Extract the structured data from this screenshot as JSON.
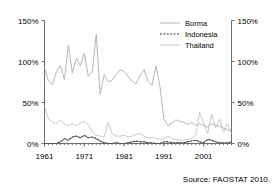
{
  "chart_data": {
    "type": "line",
    "title": "",
    "subtitle": "",
    "xlabel": "",
    "ylabel": "",
    "xlim": [
      1961,
      2008
    ],
    "ylim": [
      0,
      150
    ],
    "y_unit": "%",
    "grid": false,
    "legend_position": "top-right",
    "dual_y_axis": true,
    "source_note": "Source: FAOSTAT 2010.",
    "yticks": [
      0,
      50,
      100,
      150
    ],
    "ytick_labels": [
      "0%",
      "50%",
      "100%",
      "150%"
    ],
    "ytick_labels_right": [
      "0%",
      "50%",
      "100%",
      "150%"
    ],
    "xticks": [
      1961,
      1971,
      1981,
      1991,
      2001
    ],
    "xtick_labels": [
      "1961",
      "1971",
      "1981",
      "1991",
      "2001"
    ],
    "x": [
      1961,
      1962,
      1963,
      1964,
      1965,
      1966,
      1967,
      1968,
      1969,
      1970,
      1971,
      1972,
      1973,
      1974,
      1975,
      1976,
      1977,
      1978,
      1979,
      1980,
      1981,
      1982,
      1983,
      1984,
      1985,
      1986,
      1987,
      1988,
      1989,
      1990,
      1991,
      1992,
      1993,
      1994,
      1995,
      1996,
      1997,
      1998,
      1999,
      2000,
      2001,
      2002,
      2003,
      2004,
      2005,
      2006,
      2007,
      2008
    ],
    "series": [
      {
        "name": "Burma",
        "color": "#b6b6b6",
        "style": "solid",
        "values": [
          92,
          76,
          72,
          88,
          95,
          78,
          120,
          86,
          104,
          95,
          110,
          82,
          87,
          133,
          60,
          84,
          75,
          77,
          84,
          90,
          88,
          82,
          76,
          73,
          83,
          90,
          76,
          71,
          95,
          70,
          30,
          22,
          25,
          29,
          27,
          26,
          23,
          26,
          22,
          24,
          22,
          20,
          24,
          22,
          21,
          19,
          17,
          14
        ]
      },
      {
        "name": "Indonesia",
        "color": "#3a3a3a",
        "style": "dashed",
        "values": [
          0,
          0,
          0,
          0,
          2,
          6,
          4,
          8,
          9,
          7,
          10,
          7,
          8,
          6,
          3,
          1,
          0,
          0,
          1,
          0,
          0,
          1,
          2,
          3,
          2,
          2,
          1,
          1,
          0,
          0,
          2,
          2,
          1,
          1,
          1,
          1,
          2,
          3,
          4,
          2,
          1,
          5,
          4,
          2,
          1,
          1,
          1,
          2
        ]
      },
      {
        "name": "Thailand",
        "color": "#c9c9c9",
        "style": "solid",
        "values": [
          45,
          30,
          26,
          24,
          29,
          24,
          22,
          24,
          22,
          25,
          27,
          23,
          14,
          10,
          9,
          8,
          26,
          12,
          9,
          9,
          10,
          8,
          9,
          11,
          12,
          9,
          7,
          7,
          6,
          5,
          6,
          9,
          6,
          5,
          4,
          4,
          5,
          6,
          10,
          38,
          25,
          12,
          36,
          19,
          30,
          14,
          24,
          12
        ]
      }
    ]
  },
  "legend": {
    "items": [
      {
        "label": "Burma"
      },
      {
        "label": "Indonesia"
      },
      {
        "label": "Thailand"
      }
    ]
  },
  "source": {
    "text": "Source: FAOSTAT 2010."
  }
}
